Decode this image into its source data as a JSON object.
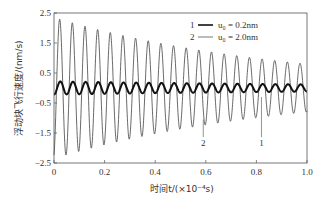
{
  "chart_data": {
    "type": "line",
    "title": "",
    "xlabel": "时间t/(×10⁻⁴s)",
    "ylabel": "浮动块飞行速度/(nm/s)",
    "xlim": [
      0,
      1.0
    ],
    "ylim": [
      -2.5,
      2.5
    ],
    "xticks": [
      "0",
      "0.2",
      "0.4",
      "0.6",
      "0.8",
      "1.0"
    ],
    "yticks": [
      "2.5",
      "1.5",
      "0.5",
      "-0.5",
      "-1.5",
      "-2.5"
    ],
    "grid": false,
    "legend_position": "upper right",
    "series": [
      {
        "name": "u₀ = 0.2nm",
        "label_number": "1",
        "style": "thick",
        "color": "#111111",
        "period": 0.05,
        "amplitude_start": 0.22,
        "amplitude_end": 0.12,
        "peaks_approx": [
          {
            "t": 0.04,
            "v": 0.22
          },
          {
            "t": 0.5,
            "v": 0.18
          },
          {
            "t": 0.98,
            "v": 0.12
          }
        ]
      },
      {
        "name": "u₀ = 2.0nm",
        "label_number": "2",
        "style": "thin",
        "color": "#444444",
        "period": 0.05,
        "amplitude_start": 2.35,
        "amplitude_end": 0.8,
        "peaks_approx": [
          {
            "t": 0.03,
            "v": 2.3
          },
          {
            "t": 0.08,
            "v": 1.95
          },
          {
            "t": 0.13,
            "v": 1.85
          },
          {
            "t": 0.18,
            "v": 1.7
          },
          {
            "t": 0.23,
            "v": 1.55
          },
          {
            "t": 0.28,
            "v": 1.45
          },
          {
            "t": 0.33,
            "v": 1.4
          },
          {
            "t": 0.38,
            "v": 1.35
          },
          {
            "t": 0.43,
            "v": 1.25
          },
          {
            "t": 0.48,
            "v": 1.15
          },
          {
            "t": 0.53,
            "v": 1.1
          },
          {
            "t": 0.58,
            "v": 1.05
          },
          {
            "t": 0.63,
            "v": 1.0
          },
          {
            "t": 0.68,
            "v": 0.95
          },
          {
            "t": 0.73,
            "v": 0.9
          },
          {
            "t": 0.78,
            "v": 0.9
          },
          {
            "t": 0.83,
            "v": 0.85
          },
          {
            "t": 0.88,
            "v": 0.85
          },
          {
            "t": 0.93,
            "v": 0.8
          },
          {
            "t": 0.98,
            "v": 0.8
          }
        ]
      }
    ],
    "annotations": [
      {
        "text": "2",
        "x": 0.59,
        "arrow_to": -1.05
      },
      {
        "text": "1",
        "x": 0.82,
        "arrow_to": -0.3
      }
    ]
  },
  "legend": {
    "items": [
      {
        "num": "1",
        "text": "u₀ = 0.2nm"
      },
      {
        "num": "2",
        "text": "u₀ = 2.0nm"
      }
    ]
  },
  "axes": {
    "xlabel": "时间t/(×10⁻⁴s)",
    "ylabel": "浮动块飞行速度/(nm/s)"
  }
}
